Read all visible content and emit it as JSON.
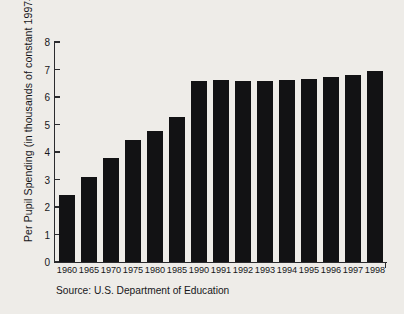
{
  "figure": {
    "ylabel": "Per Pupil Spending (in thousands of constant 1997–98 dollars)",
    "source": "Source: U.S. Department of Education"
  },
  "chart_data": {
    "type": "bar",
    "title": "",
    "xlabel": "",
    "ylabel": "Per Pupil Spending (in thousands of constant 1997–98 dollars)",
    "categories": [
      "1960",
      "1965",
      "1970",
      "1975",
      "1980",
      "1985",
      "1990",
      "1991",
      "1992",
      "1993",
      "1994",
      "1995",
      "1996",
      "1997",
      "1998"
    ],
    "values": [
      2.42,
      3.1,
      3.77,
      4.43,
      4.77,
      5.27,
      6.6,
      6.62,
      6.58,
      6.59,
      6.62,
      6.66,
      6.73,
      6.8,
      6.93
    ],
    "ylim": [
      0,
      8
    ],
    "yticks": [
      0,
      1,
      2,
      3,
      4,
      5,
      6,
      7,
      8
    ],
    "ytick_labels": [
      "0",
      "1",
      "2",
      "3",
      "4",
      "5",
      "6",
      "7",
      "8"
    ],
    "grid": false,
    "legend": null,
    "bar_color": "#121214",
    "background_color": "#eeece8",
    "axis_color": "#2b2b2e",
    "annotations": [
      "Source: U.S. Department of Education"
    ]
  }
}
